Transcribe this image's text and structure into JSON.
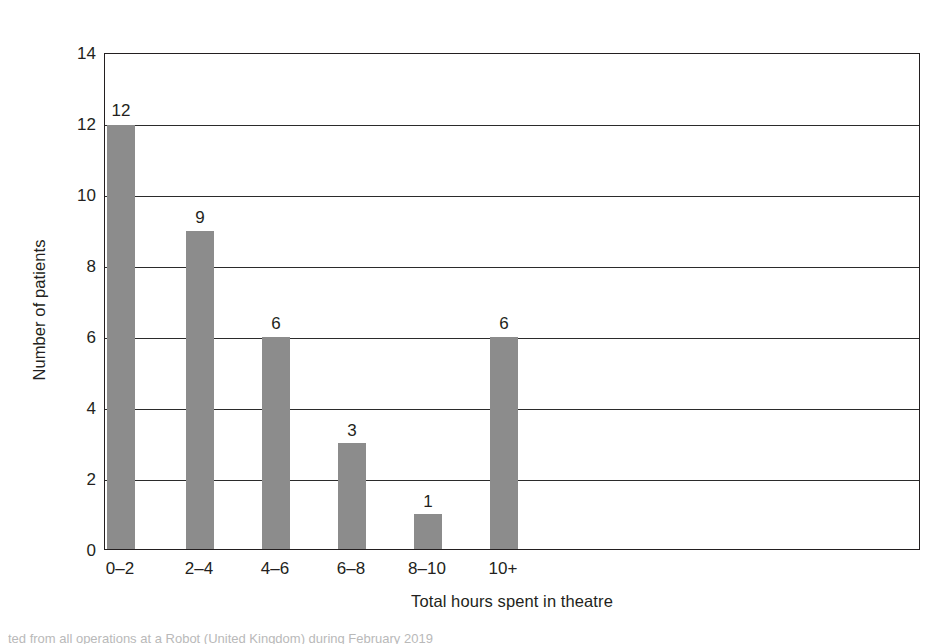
{
  "chart_data": {
    "type": "bar",
    "title": "",
    "subtitle": "",
    "xlabel": "Total hours spent in theatre",
    "ylabel": "Number of patients",
    "categories": [
      "0–2",
      "2–4",
      "4–6",
      "6–8",
      "8–10",
      "10+"
    ],
    "values": [
      12,
      9,
      6,
      3,
      1,
      6
    ],
    "value_labels": [
      "12",
      "9",
      "6",
      "3",
      "1",
      "6"
    ],
    "ylim": [
      0,
      14
    ],
    "ytick_labels": [
      "0",
      "2",
      "4",
      "6",
      "8",
      "10",
      "12",
      "14"
    ],
    "ytick_values": [
      0,
      2,
      4,
      6,
      8,
      10,
      12,
      14
    ],
    "grid": "horizontal",
    "legend": "none",
    "bar_color": "#8c8c8c",
    "axis_color": "#231f20",
    "gridline_color": "#2b2b2b",
    "background_color": "#ffffff"
  },
  "caption": {
    "text": "ted from all operations at a Robot (United Kingdom) during February 2019"
  }
}
